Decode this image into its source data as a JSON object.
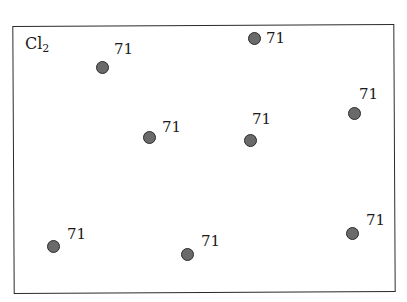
{
  "title": {
    "base": "Cl",
    "subscript": "2"
  },
  "colors": {
    "dot_fill": "#6a6a6a",
    "dot_stroke": "#2a2a2a",
    "border": "#2a2a2a"
  },
  "molecules": [
    {
      "label": "71",
      "x": 102,
      "y": 67,
      "lx": 114,
      "ly": 42
    },
    {
      "label": "71",
      "x": 254,
      "y": 38,
      "lx": 266,
      "ly": 31
    },
    {
      "label": "71",
      "x": 354,
      "y": 113,
      "lx": 359,
      "ly": 87
    },
    {
      "label": "71",
      "x": 149,
      "y": 137,
      "lx": 162,
      "ly": 120
    },
    {
      "label": "71",
      "x": 250,
      "y": 140,
      "lx": 252,
      "ly": 112
    },
    {
      "label": "71",
      "x": 53,
      "y": 246,
      "lx": 67,
      "ly": 227
    },
    {
      "label": "71",
      "x": 187,
      "y": 254,
      "lx": 201,
      "ly": 234
    },
    {
      "label": "71",
      "x": 352,
      "y": 233,
      "lx": 366,
      "ly": 213
    }
  ]
}
